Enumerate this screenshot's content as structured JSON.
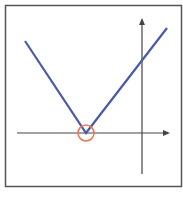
{
  "figure": {
    "colors": {
      "frame": "#555555",
      "axes": "#444444",
      "curve": "#4a5aa8",
      "highlight": "#e87a5a",
      "background": "#ffffff"
    },
    "function": "V-shaped absolute value graph",
    "vertex_label": "",
    "highlight_marker": "circle-at-vertex"
  }
}
